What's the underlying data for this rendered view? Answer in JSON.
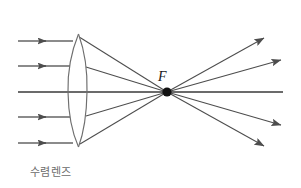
{
  "figure": {
    "caption": "수렴렌즈",
    "caption_color": "#6b6b6b",
    "background_color": "#ffffff",
    "width": 301,
    "height": 188
  },
  "diagram": {
    "type": "ray-diagram",
    "focal_point_label": "F",
    "line_color": "#4d4d4d",
    "axis_color": "#3a3a3a",
    "lens_color": "#6e6e6e",
    "focal_dot_color": "#111111",
    "optical_axis": {
      "x1": 18,
      "y1": 92,
      "x2": 283,
      "y2": 92
    },
    "lens": {
      "center_x": 78,
      "top_y": 34,
      "bottom_y": 147,
      "left_bulge_x": 68,
      "right_bulge_x": 87
    },
    "focal_point": {
      "x": 167,
      "y": 92,
      "radius": 4.6
    },
    "focal_label_pos": {
      "x": 158,
      "y": 81
    },
    "incoming_rays": [
      {
        "y": 41,
        "x_start": 18,
        "x_arrow": 46,
        "x_end": 72
      },
      {
        "y": 66,
        "x_start": 18,
        "x_arrow": 46,
        "x_end": 69
      },
      {
        "y": 117,
        "x_start": 18,
        "x_arrow": 46,
        "x_end": 69
      },
      {
        "y": 143,
        "x_start": 18,
        "x_arrow": 46,
        "x_end": 72
      }
    ],
    "refracted_rays": [
      {
        "x1": 80,
        "y1": 37,
        "x2": 167,
        "y2": 92
      },
      {
        "x1": 86,
        "y1": 68,
        "x2": 167,
        "y2": 92
      },
      {
        "x1": 86,
        "y1": 116,
        "x2": 167,
        "y2": 92
      },
      {
        "x1": 80,
        "y1": 144,
        "x2": 167,
        "y2": 92
      }
    ],
    "diverging_rays": [
      {
        "x1": 167,
        "y1": 92,
        "x2": 264,
        "y2": 37
      },
      {
        "x1": 167,
        "y1": 92,
        "x2": 281,
        "y2": 59
      },
      {
        "x1": 167,
        "y1": 92,
        "x2": 281,
        "y2": 126
      },
      {
        "x1": 167,
        "y1": 92,
        "x2": 264,
        "y2": 147
      }
    ]
  }
}
